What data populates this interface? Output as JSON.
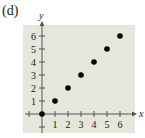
{
  "panel_label": "(d)",
  "chart_data": {
    "type": "scatter",
    "title": "",
    "xlabel": "x",
    "ylabel": "y",
    "x": [
      0,
      1,
      2,
      3,
      4,
      5,
      6
    ],
    "y": [
      0,
      1,
      2,
      3,
      4,
      5,
      6
    ],
    "xticks": [
      "1",
      "2",
      "3",
      "4",
      "5",
      "6"
    ],
    "yticks": [
      "1",
      "2",
      "3",
      "4",
      "5",
      "6"
    ],
    "xlim": [
      -1,
      7
    ],
    "ylim": [
      -1,
      7
    ],
    "grid": false,
    "background": "#e6e7dc",
    "point_color": "#000000"
  }
}
